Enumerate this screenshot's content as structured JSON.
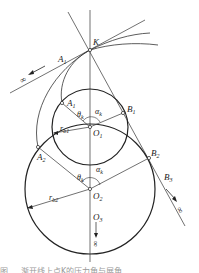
{
  "figure": {
    "labels": {
      "K": "K",
      "A1_tangent": "A",
      "A1_tangent_sub": "1",
      "A1": "A",
      "A1_sub": "1",
      "B1": "B",
      "B1_sub": "1",
      "O1": "O",
      "O1_sub": "1",
      "A2": "A",
      "A2_sub": "2",
      "B2": "B",
      "B2_sub": "2",
      "O2": "O",
      "O2_sub": "2",
      "B3": "B",
      "B3_sub": "3",
      "O3": "O",
      "O3_sub": "3",
      "theta_k_1": "θ",
      "theta_k_1_sub": "k",
      "alpha_k_1": "α",
      "alpha_k_1_sub": "k",
      "theta_k_2": "θ",
      "theta_k_2_sub": "k",
      "alpha_k_2": "α",
      "alpha_k_2_sub": "k",
      "rb1": "r",
      "rb1_sub": "b1",
      "rb2": "r",
      "rb2_sub": "b2",
      "infinity_left": "∞",
      "infinity_right": "∞",
      "infinity_bottom": "∞"
    },
    "caption": "图 … 渐开线上点K的压力角与展角"
  }
}
